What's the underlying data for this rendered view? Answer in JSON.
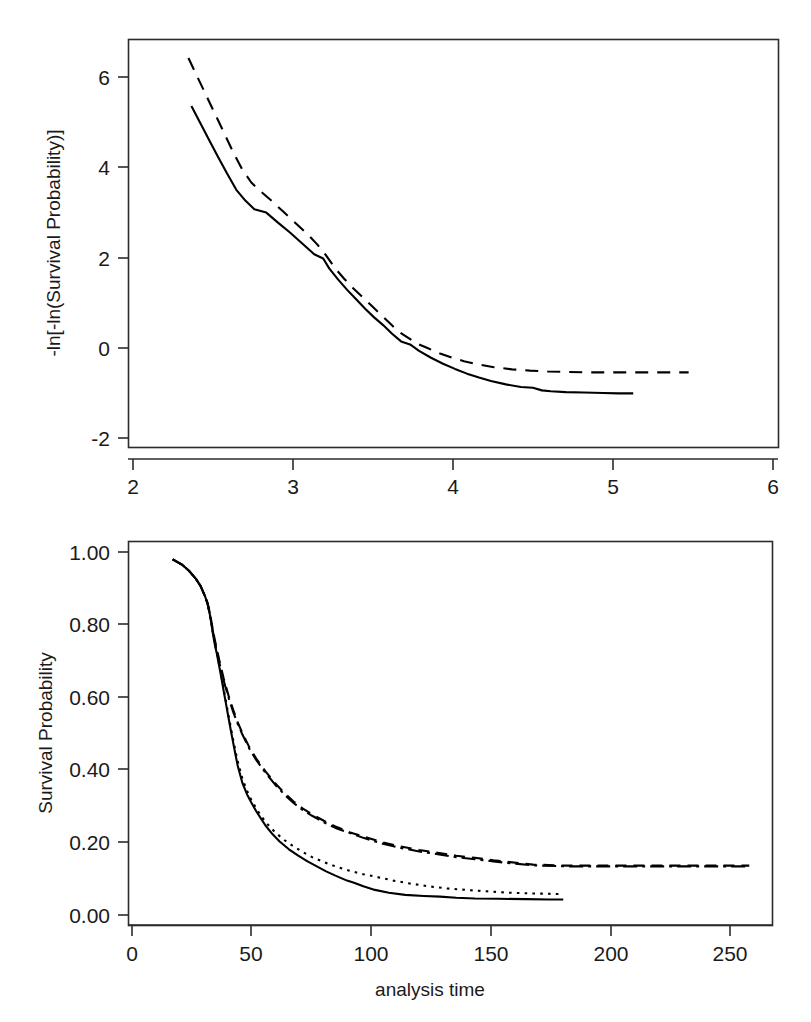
{
  "figure": {
    "background": "#ffffff",
    "stroke_color": "#000000",
    "panels": 2
  },
  "chart_data": [
    {
      "id": "log-log-survival",
      "type": "line",
      "title": "",
      "xlabel": "ln(analysis time)",
      "ylabel": "-ln[-ln(Survival Probability)]",
      "xlim": [
        1.78,
        6.12
      ],
      "ylim": [
        -2.45,
        7.05
      ],
      "xticks": [
        2,
        3,
        4,
        5,
        6
      ],
      "xtick_labels": [
        "2",
        "3",
        "4",
        "5",
        "6"
      ],
      "yticks": [
        -2,
        0,
        2,
        4,
        6
      ],
      "ytick_labels": [
        "-2",
        "0",
        "2",
        "4",
        "6"
      ],
      "grid": false,
      "legend": "none",
      "series": [
        {
          "name": "group-1",
          "style": "solid",
          "dasharray": "",
          "x": [
            2.2,
            2.26,
            2.32,
            2.38,
            2.44,
            2.5,
            2.56,
            2.62,
            2.7,
            2.78,
            2.86,
            2.94,
            3.02,
            3.08,
            3.12,
            3.18,
            3.24,
            3.3,
            3.36,
            3.42,
            3.48,
            3.54,
            3.6,
            3.66,
            3.72,
            3.8,
            3.88,
            3.96,
            4.04,
            4.12,
            4.2,
            4.3,
            4.4,
            4.48,
            4.54,
            4.6,
            4.7,
            4.82,
            4.95,
            5.05,
            5.15
          ],
          "y": [
            5.5,
            5.1,
            4.7,
            4.3,
            3.92,
            3.55,
            3.3,
            3.1,
            3.02,
            2.78,
            2.55,
            2.3,
            2.05,
            1.95,
            1.72,
            1.46,
            1.22,
            1.0,
            0.78,
            0.58,
            0.4,
            0.2,
            0.02,
            -0.05,
            -0.2,
            -0.36,
            -0.5,
            -0.62,
            -0.73,
            -0.82,
            -0.9,
            -0.98,
            -1.04,
            -1.06,
            -1.12,
            -1.14,
            -1.16,
            -1.17,
            -1.18,
            -1.19,
            -1.19
          ]
        },
        {
          "name": "group-2",
          "style": "dashed",
          "dasharray": "13,9",
          "x": [
            2.18,
            2.24,
            2.3,
            2.36,
            2.42,
            2.48,
            2.54,
            2.6,
            2.66,
            2.74,
            2.82,
            2.9,
            2.98,
            3.04,
            3.1,
            3.16,
            3.22,
            3.28,
            3.34,
            3.4,
            3.46,
            3.52,
            3.58,
            3.64,
            3.7,
            3.78,
            3.86,
            3.94,
            4.02,
            4.12,
            4.22,
            4.34,
            4.46,
            4.58,
            4.7,
            4.82,
            4.95,
            5.05,
            5.2,
            5.36,
            5.52
          ],
          "y": [
            6.62,
            6.18,
            5.74,
            5.3,
            4.86,
            4.42,
            4.02,
            3.72,
            3.52,
            3.28,
            3.02,
            2.76,
            2.5,
            2.28,
            2.02,
            1.72,
            1.48,
            1.26,
            1.06,
            0.86,
            0.66,
            0.46,
            0.26,
            0.12,
            -0.02,
            -0.14,
            -0.26,
            -0.36,
            -0.44,
            -0.52,
            -0.58,
            -0.63,
            -0.66,
            -0.68,
            -0.69,
            -0.7,
            -0.7,
            -0.7,
            -0.7,
            -0.7,
            -0.7
          ]
        }
      ]
    },
    {
      "id": "kaplan-meier-survival",
      "type": "line",
      "title": "",
      "xlabel": "analysis time",
      "ylabel": "Survival Probability",
      "xlim": [
        -9,
        268
      ],
      "ylim": [
        -0.028,
        1.05
      ],
      "xticks": [
        0,
        50,
        100,
        150,
        200,
        250
      ],
      "xtick_labels": [
        "0",
        "50",
        "100",
        "150",
        "200",
        "250"
      ],
      "yticks": [
        0.0,
        0.2,
        0.4,
        0.6,
        0.8,
        1.0
      ],
      "ytick_labels": [
        "0.00",
        "0.20",
        "0.40",
        "0.60",
        "0.80",
        "1.00"
      ],
      "grid": false,
      "legend": "none",
      "series": [
        {
          "name": "curve-solid",
          "style": "solid",
          "dasharray": "",
          "x": [
            10,
            14,
            17,
            20,
            22,
            24,
            25,
            26,
            27,
            28,
            29,
            30,
            31,
            32,
            33,
            34,
            35,
            36,
            37,
            38,
            40,
            42,
            44,
            46,
            48,
            50,
            53,
            56,
            60,
            64,
            68,
            72,
            76,
            80,
            85,
            88,
            92,
            97,
            103,
            110,
            118,
            125,
            132,
            140,
            150,
            162,
            172,
            178
          ],
          "y": [
            1.0,
            0.985,
            0.968,
            0.945,
            0.925,
            0.895,
            0.875,
            0.845,
            0.805,
            0.765,
            0.735,
            0.7,
            0.665,
            0.628,
            0.592,
            0.556,
            0.52,
            0.486,
            0.452,
            0.42,
            0.372,
            0.34,
            0.315,
            0.292,
            0.272,
            0.252,
            0.228,
            0.208,
            0.186,
            0.168,
            0.152,
            0.138,
            0.124,
            0.112,
            0.098,
            0.092,
            0.082,
            0.072,
            0.064,
            0.058,
            0.055,
            0.053,
            0.05,
            0.048,
            0.047,
            0.046,
            0.045,
            0.045
          ]
        },
        {
          "name": "curve-dotted",
          "style": "dotted",
          "dasharray": "2.6,5.2",
          "x": [
            10,
            14,
            17,
            20,
            22,
            24,
            25,
            26,
            27,
            28,
            29,
            30,
            31,
            32,
            33,
            34,
            35,
            36,
            37,
            38,
            40,
            42,
            44,
            46,
            48,
            50,
            54,
            58,
            62,
            66,
            70,
            75,
            80,
            86,
            92,
            98,
            105,
            112,
            120,
            128,
            136,
            145,
            155,
            165,
            172,
            178
          ],
          "y": [
            1.0,
            0.985,
            0.968,
            0.945,
            0.925,
            0.895,
            0.875,
            0.845,
            0.805,
            0.768,
            0.738,
            0.705,
            0.67,
            0.634,
            0.598,
            0.562,
            0.528,
            0.494,
            0.462,
            0.432,
            0.384,
            0.35,
            0.322,
            0.3,
            0.28,
            0.262,
            0.234,
            0.212,
            0.194,
            0.178,
            0.164,
            0.15,
            0.138,
            0.126,
            0.116,
            0.108,
            0.098,
            0.09,
            0.082,
            0.076,
            0.072,
            0.068,
            0.064,
            0.062,
            0.061,
            0.06
          ]
        },
        {
          "name": "curve-dashed",
          "style": "dashed",
          "dasharray": "11,7",
          "x": [
            10,
            14,
            17,
            20,
            22,
            24,
            25,
            26,
            27,
            28,
            30,
            32,
            34,
            36,
            38,
            40,
            43,
            46,
            50,
            54,
            58,
            62,
            66,
            70,
            75,
            80,
            86,
            92,
            100,
            108,
            116,
            124,
            132,
            140,
            148,
            155,
            165,
            180,
            200,
            220,
            240,
            258
          ],
          "y": [
            1.0,
            0.985,
            0.968,
            0.945,
            0.925,
            0.895,
            0.878,
            0.85,
            0.812,
            0.778,
            0.718,
            0.664,
            0.618,
            0.578,
            0.542,
            0.512,
            0.472,
            0.44,
            0.404,
            0.372,
            0.344,
            0.32,
            0.3,
            0.284,
            0.266,
            0.25,
            0.234,
            0.222,
            0.206,
            0.194,
            0.184,
            0.176,
            0.168,
            0.162,
            0.155,
            0.15,
            0.143,
            0.14,
            0.14,
            0.14,
            0.14,
            0.14
          ]
        },
        {
          "name": "curve-dashdot",
          "style": "dashdot",
          "dasharray": "14,5,3,5",
          "x": [
            10,
            14,
            17,
            20,
            22,
            24,
            25,
            26,
            27,
            28,
            30,
            32,
            34,
            36,
            38,
            40,
            43,
            46,
            50,
            54,
            58,
            62,
            66,
            70,
            75,
            80,
            86,
            92,
            100,
            108,
            116,
            124,
            132,
            140,
            148,
            155,
            165,
            180,
            200,
            220,
            240,
            258
          ],
          "y": [
            1.0,
            0.985,
            0.968,
            0.945,
            0.925,
            0.895,
            0.876,
            0.848,
            0.808,
            0.772,
            0.712,
            0.658,
            0.612,
            0.572,
            0.538,
            0.508,
            0.468,
            0.436,
            0.4,
            0.368,
            0.34,
            0.316,
            0.296,
            0.28,
            0.262,
            0.246,
            0.232,
            0.218,
            0.202,
            0.19,
            0.18,
            0.172,
            0.164,
            0.158,
            0.152,
            0.147,
            0.141,
            0.138,
            0.138,
            0.138,
            0.138,
            0.138
          ]
        }
      ]
    }
  ]
}
